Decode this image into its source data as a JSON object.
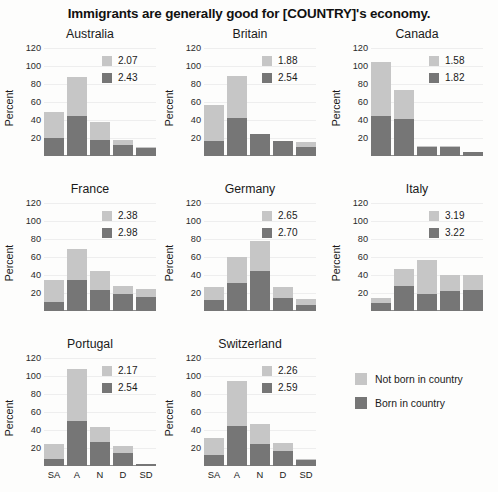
{
  "chart_data": {
    "type": "bar",
    "title": "Immigrants are generally good for [COUNTRY]'s economy.",
    "xlabel": "",
    "ylabel": "Percent",
    "ylim": [
      0,
      120
    ],
    "yticks": [
      20,
      40,
      60,
      80,
      100,
      120
    ],
    "categories": [
      "SA",
      "A",
      "N",
      "D",
      "SD"
    ],
    "grid": true,
    "stacked": true,
    "legend_position": "bottom-right",
    "legend": [
      {
        "label": "Not born in country",
        "color": "#c6c6c6"
      },
      {
        "label": "Born in country",
        "color": "#767676"
      }
    ],
    "series": [
      {
        "name": "Not born in country",
        "color": "#c6c6c6"
      },
      {
        "name": "Born in country",
        "color": "#767676"
      }
    ],
    "panels": [
      {
        "title": "Australia",
        "mean_not_born": "2.07",
        "mean_born": "2.43",
        "values_total": [
          49,
          88,
          38,
          18,
          10
        ],
        "values_born": [
          20,
          44,
          18,
          12,
          9
        ]
      },
      {
        "title": "Britain",
        "mean_not_born": "1.88",
        "mean_born": "2.54",
        "values_total": [
          57,
          89,
          25,
          17,
          16
        ],
        "values_born": [
          17,
          42,
          24,
          17,
          10
        ]
      },
      {
        "title": "Canada",
        "mean_not_born": "1.58",
        "mean_born": "1.82",
        "values_total": [
          104,
          73,
          11,
          11,
          5
        ],
        "values_born": [
          45,
          41,
          10,
          10,
          4
        ]
      },
      {
        "title": "France",
        "mean_not_born": "2.38",
        "mean_born": "2.98",
        "values_total": [
          35,
          69,
          45,
          28,
          25
        ],
        "values_born": [
          10,
          34,
          23,
          19,
          16
        ]
      },
      {
        "title": "Germany",
        "mean_not_born": "2.65",
        "mean_born": "2.70",
        "values_total": [
          27,
          60,
          78,
          27,
          13
        ],
        "values_born": [
          12,
          31,
          44,
          15,
          7
        ]
      },
      {
        "title": "Italy",
        "mean_not_born": "3.19",
        "mean_born": "3.22",
        "values_total": [
          15,
          47,
          57,
          40,
          40
        ],
        "values_born": [
          9,
          28,
          19,
          22,
          23
        ]
      },
      {
        "title": "Portugal",
        "mean_not_born": "2.17",
        "mean_born": "2.54",
        "values_total": [
          24,
          108,
          43,
          22,
          2
        ],
        "values_born": [
          8,
          50,
          27,
          15,
          2
        ]
      },
      {
        "title": "Switzerland",
        "mean_not_born": "2.26",
        "mean_born": "2.59",
        "values_total": [
          31,
          94,
          47,
          26,
          8
        ],
        "values_born": [
          12,
          45,
          25,
          17,
          7
        ]
      }
    ]
  }
}
